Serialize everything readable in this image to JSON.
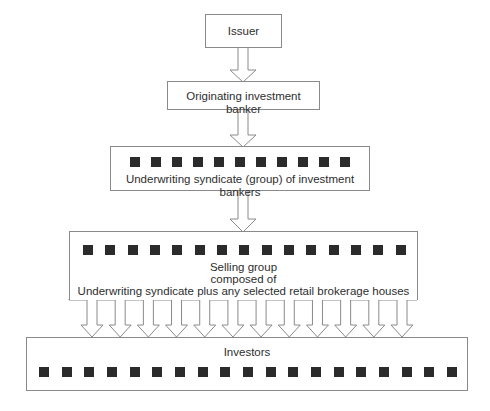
{
  "diagram": {
    "issuer": {
      "label": "Issuer"
    },
    "originator": {
      "label": "Originating investment banker"
    },
    "syndicate": {
      "label": "Underwriting syndicate (group) of investment bankers",
      "square_count": 11
    },
    "selling_group": {
      "line1": "Selling group",
      "line2": "composed of",
      "line3": "Underwriting syndicate plus any selected retail brokerage houses",
      "square_count": 15,
      "arrow_count": 12
    },
    "investors": {
      "label": "Investors",
      "square_count": 19
    }
  }
}
